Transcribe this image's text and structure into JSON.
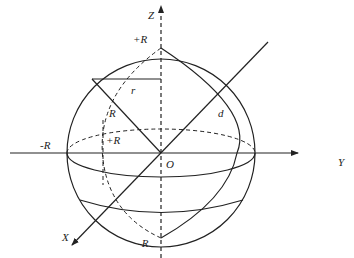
{
  "diagram": {
    "type": "sphere-coordinate-system",
    "stroke_color": "#222222",
    "axes": {
      "z_label": "Z",
      "y_label": "Y",
      "x_label": "X",
      "origin_label": "O"
    },
    "labels": {
      "top": "+R",
      "bottom": "-R",
      "left": "-R",
      "inner_plus_r": "+R",
      "radius_r_small": "r",
      "radius_R": "R",
      "distance_d": "d"
    }
  }
}
